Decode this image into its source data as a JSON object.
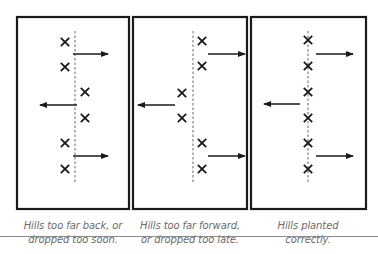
{
  "figure": {
    "colors": {
      "ink": "#1a1a1a",
      "caption": "#6b6b6b",
      "rule": "#8a8a8a",
      "background": "#ffffff"
    },
    "panels": [
      {
        "id": "too-far-back",
        "caption_line1": "Hills too far back, or",
        "caption_line2": "dropped too soon.",
        "frame": {
          "x": 17,
          "y": 17,
          "w": 112,
          "h": 192
        },
        "center_line_x": 75,
        "hills": [
          {
            "x": 65,
            "y": 42
          },
          {
            "x": 65,
            "y": 67
          },
          {
            "x": 85,
            "y": 92
          },
          {
            "x": 85,
            "y": 118
          },
          {
            "x": 65,
            "y": 143
          },
          {
            "x": 65,
            "y": 169
          }
        ],
        "arrows": [
          {
            "direction": "right",
            "y": 54,
            "x1": 73,
            "x2": 108
          },
          {
            "direction": "left",
            "y": 105,
            "x1": 77,
            "x2": 40
          },
          {
            "direction": "right",
            "y": 156,
            "x1": 73,
            "x2": 108
          }
        ]
      },
      {
        "id": "too-far-forward",
        "caption_line1": "Hills too far forward,",
        "caption_line2": "or dropped too late.",
        "frame": {
          "x": 133,
          "y": 17,
          "w": 114,
          "h": 192
        },
        "center_line_x": 193,
        "hills": [
          {
            "x": 202,
            "y": 41
          },
          {
            "x": 202,
            "y": 66
          },
          {
            "x": 182,
            "y": 93
          },
          {
            "x": 182,
            "y": 118
          },
          {
            "x": 202,
            "y": 143
          },
          {
            "x": 202,
            "y": 169
          }
        ],
        "arrows": [
          {
            "direction": "right",
            "y": 54,
            "x1": 208,
            "x2": 245
          },
          {
            "direction": "left",
            "y": 105,
            "x1": 175,
            "x2": 138
          },
          {
            "direction": "right",
            "y": 156,
            "x1": 208,
            "x2": 245
          }
        ]
      },
      {
        "id": "planted-correctly",
        "caption_line1": "Hills planted",
        "caption_line2": "correctly.",
        "frame": {
          "x": 251,
          "y": 17,
          "w": 115,
          "h": 192
        },
        "center_line_x": 308,
        "hills": [
          {
            "x": 308,
            "y": 40
          },
          {
            "x": 308,
            "y": 66
          },
          {
            "x": 308,
            "y": 92
          },
          {
            "x": 308,
            "y": 118
          },
          {
            "x": 308,
            "y": 143
          },
          {
            "x": 308,
            "y": 169
          }
        ],
        "arrows": [
          {
            "direction": "right",
            "y": 54,
            "x1": 316,
            "x2": 353
          },
          {
            "direction": "left",
            "y": 104,
            "x1": 300,
            "x2": 264
          },
          {
            "direction": "right",
            "y": 156,
            "x1": 316,
            "x2": 353
          }
        ]
      }
    ],
    "dashed_line_span": {
      "y1": 31,
      "y2": 182
    },
    "hill_marker": "X"
  }
}
